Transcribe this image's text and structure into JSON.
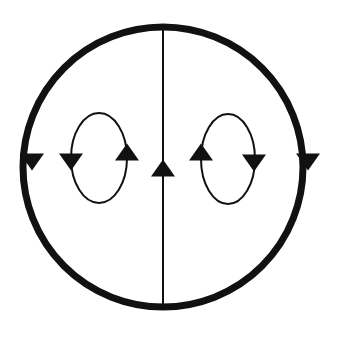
{
  "diagram": {
    "title": "",
    "colors": {
      "stroke": "#111111",
      "background": "#ffffff"
    },
    "outer_circle": {
      "cx": 163,
      "cy": 167,
      "r": 140,
      "stroke_width": 7
    },
    "center_line": {
      "x": 163,
      "y1": 27,
      "y2": 307,
      "stroke_width": 2
    },
    "loops": [
      {
        "name": "left-loop",
        "cx": 99,
        "cy": 158,
        "rx": 28,
        "ry": 45,
        "stroke_width": 2,
        "direction": "counterclockwise"
      },
      {
        "name": "right-loop",
        "cx": 228,
        "cy": 159,
        "rx": 27,
        "ry": 45,
        "stroke_width": 2,
        "direction": "clockwise"
      }
    ],
    "arrows": [
      {
        "name": "outer-left-arrow",
        "x": 32,
        "y": 162,
        "dir": "down"
      },
      {
        "name": "outer-right-arrow",
        "x": 308,
        "y": 162,
        "dir": "down"
      },
      {
        "name": "center-arrow",
        "x": 163,
        "y": 168,
        "dir": "up"
      },
      {
        "name": "left-loop-left-arrow",
        "x": 71,
        "y": 162,
        "dir": "down"
      },
      {
        "name": "left-loop-right-arrow",
        "x": 127,
        "y": 152,
        "dir": "up"
      },
      {
        "name": "right-loop-left-arrow",
        "x": 201,
        "y": 152,
        "dir": "up"
      },
      {
        "name": "right-loop-right-arrow",
        "x": 254,
        "y": 163,
        "dir": "down"
      }
    ]
  }
}
